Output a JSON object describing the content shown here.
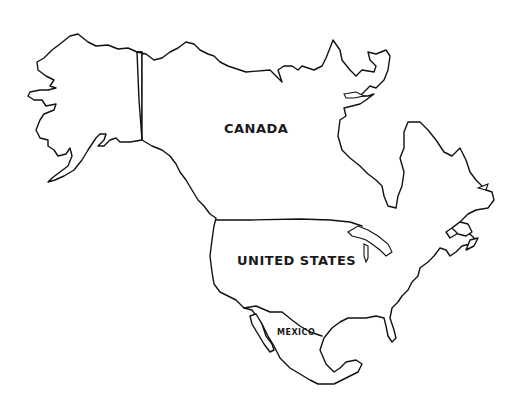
{
  "map": {
    "title": "North America outline map",
    "style": "black-and-white line drawing",
    "colors": {
      "background": "#ffffff",
      "stroke": "#111111",
      "label": "#1a1a1a"
    },
    "countries": [
      {
        "id": "canada",
        "label": "CANADA"
      },
      {
        "id": "united-states",
        "label": "UNITED STATES"
      },
      {
        "id": "mexico",
        "label": "MEXICO"
      }
    ],
    "regions_outlined": [
      "Alaska",
      "Canada",
      "Greenland-facing Arctic islands",
      "Hudson Bay",
      "Great Lakes",
      "Florida",
      "Baja California",
      "Gulf of Mexico",
      "Yucatan"
    ]
  }
}
